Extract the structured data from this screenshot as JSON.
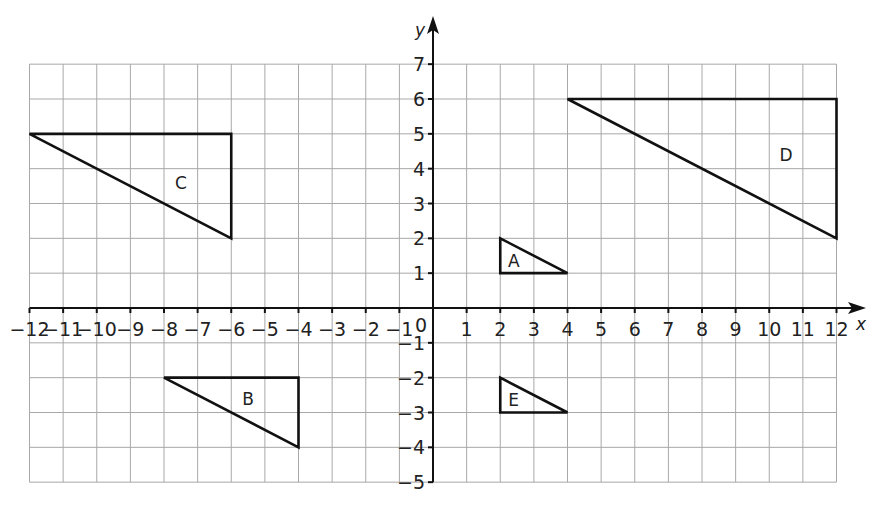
{
  "diagram": {
    "type": "coordinate-grid",
    "x_axis": {
      "label": "x",
      "min": -12,
      "max": 12,
      "ticks": [
        "−12",
        "−11",
        "−10",
        "−9",
        "−8",
        "−7",
        "−6",
        "−5",
        "−4",
        "−3",
        "−2",
        "−1",
        "1",
        "2",
        "3",
        "4",
        "5",
        "6",
        "7",
        "8",
        "9",
        "10",
        "11",
        "12"
      ]
    },
    "y_axis": {
      "label": "y",
      "min": -5,
      "max": 7,
      "ticks": [
        "7",
        "6",
        "5",
        "4",
        "3",
        "2",
        "1",
        "−1",
        "−2",
        "−3",
        "−4",
        "−5"
      ]
    },
    "origin_label": "0",
    "shapes": [
      {
        "label": "A",
        "vertices": [
          [
            2,
            2
          ],
          [
            2,
            1
          ],
          [
            4,
            1
          ]
        ],
        "label_pos": [
          2.4,
          1.35
        ]
      },
      {
        "label": "B",
        "vertices": [
          [
            -8,
            -2
          ],
          [
            -4,
            -2
          ],
          [
            -4,
            -4
          ]
        ],
        "label_pos": [
          -5.5,
          -2.6
        ]
      },
      {
        "label": "C",
        "vertices": [
          [
            -12,
            5
          ],
          [
            -6,
            5
          ],
          [
            -6,
            2
          ]
        ],
        "label_pos": [
          -7.5,
          3.6
        ]
      },
      {
        "label": "D",
        "vertices": [
          [
            4,
            6
          ],
          [
            12,
            6
          ],
          [
            12,
            2
          ]
        ],
        "label_pos": [
          10.5,
          4.4
        ]
      },
      {
        "label": "E",
        "vertices": [
          [
            2,
            -2
          ],
          [
            2,
            -3
          ],
          [
            4,
            -3
          ]
        ],
        "label_pos": [
          2.4,
          -2.65
        ]
      }
    ],
    "colors": {
      "grid": "#a8a8a8",
      "axes": "#111111",
      "shapes": "#111111"
    }
  }
}
